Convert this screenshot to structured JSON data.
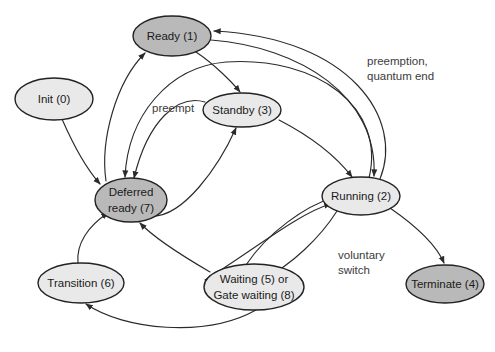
{
  "diagram": {
    "type": "state-transition-diagram",
    "canvas": {
      "width": 495,
      "height": 352,
      "background": "#ffffff"
    },
    "colors": {
      "node_fill_dark": "#b9b9b9",
      "node_fill_light": "#e9e9e9",
      "node_stroke": "#222222",
      "edge_stroke": "#2b2b2b",
      "node_text": "#1a1a1a",
      "edge_text": "#3b3b3b"
    },
    "nodes": [
      {
        "id": "ready",
        "label": "Ready (1)",
        "line1": "Ready (1)",
        "line2": "",
        "cx": 172,
        "cy": 36,
        "rx": 39,
        "ry": 20,
        "shade": "dark"
      },
      {
        "id": "init",
        "label": "Init (0)",
        "line1": "Init (0)",
        "line2": "",
        "cx": 54,
        "cy": 99,
        "rx": 39,
        "ry": 21,
        "shade": "light"
      },
      {
        "id": "standby",
        "label": "Standby (3)",
        "line1": "Standby (3)",
        "line2": "",
        "cx": 242,
        "cy": 110,
        "rx": 39,
        "ry": 17,
        "shade": "light"
      },
      {
        "id": "deferred_ready",
        "label": "Deferred ready (7)",
        "line1": "Deferred",
        "line2": "ready (7)",
        "cx": 131,
        "cy": 200,
        "rx": 36,
        "ry": 22,
        "shade": "dark"
      },
      {
        "id": "running",
        "label": "Running (2)",
        "line1": "Running (2)",
        "line2": "",
        "cx": 361,
        "cy": 196,
        "rx": 39,
        "ry": 19,
        "shade": "light"
      },
      {
        "id": "transition",
        "label": "Transition (6)",
        "line1": "Transition (6)",
        "line2": "",
        "cx": 81,
        "cy": 283,
        "rx": 43,
        "ry": 20,
        "shade": "light"
      },
      {
        "id": "waiting",
        "label": "Waiting (5) or Gate waiting (8)",
        "line1": "Waiting (5) or",
        "line2": "Gate waiting (8)",
        "cx": 254,
        "cy": 287,
        "rx": 50,
        "ry": 23,
        "shade": "light"
      },
      {
        "id": "terminate",
        "label": "Terminate (4)",
        "line1": "Terminate (4)",
        "line2": "",
        "cx": 445,
        "cy": 284,
        "rx": 39,
        "ry": 19,
        "shade": "dark"
      }
    ],
    "edge_labels": [
      {
        "id": "preemption-quantum-end",
        "line1": "preemption,",
        "line2": "quantum end",
        "x": 367,
        "y": 62
      },
      {
        "id": "preempt",
        "line1": "preempt",
        "line2": "",
        "x": 152,
        "y": 109
      },
      {
        "id": "voluntary-switch",
        "line1": "voluntary",
        "line2": "switch",
        "x": 338,
        "y": 256
      }
    ],
    "edges": [
      {
        "id": "init-to-deferred-ready",
        "from": "init",
        "to": "deferred_ready"
      },
      {
        "id": "deferred-ready-to-ready",
        "from": "deferred_ready",
        "to": "ready"
      },
      {
        "id": "standby-to-deferred-ready",
        "from": "standby",
        "to": "deferred_ready"
      },
      {
        "id": "deferred-ready-to-standby",
        "from": "deferred_ready",
        "to": "standby"
      },
      {
        "id": "standby-to-running",
        "from": "standby",
        "to": "running"
      },
      {
        "id": "running-to-ready-preemption",
        "from": "running",
        "to": "ready"
      },
      {
        "id": "running-to-deferred-ready",
        "from": "running",
        "to": "deferred_ready"
      },
      {
        "id": "ready-to-standby",
        "from": "ready",
        "to": "standby"
      },
      {
        "id": "running-to-waiting-voluntary-switch",
        "from": "running",
        "to": "waiting"
      },
      {
        "id": "waiting-to-running",
        "from": "waiting",
        "to": "running"
      },
      {
        "id": "waiting-to-deferred-ready",
        "from": "waiting",
        "to": "deferred_ready"
      },
      {
        "id": "waiting-to-transition",
        "from": "waiting",
        "to": "transition"
      },
      {
        "id": "transition-to-deferred-ready",
        "from": "transition",
        "to": "deferred_ready"
      },
      {
        "id": "running-to-terminate",
        "from": "running",
        "to": "terminate"
      }
    ]
  }
}
